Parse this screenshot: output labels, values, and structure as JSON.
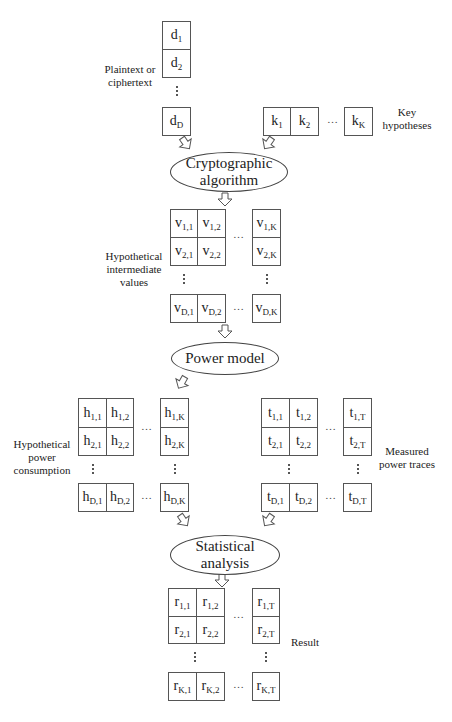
{
  "diagram": {
    "type": "flowchart",
    "title": "",
    "inputs": {
      "plaintext": {
        "label": "Plaintext or ciphertext",
        "cells": [
          "d1",
          "d2",
          "dD"
        ]
      },
      "keys": {
        "label": "Key hypotheses",
        "cells": [
          "k1",
          "k2",
          "kK"
        ]
      }
    },
    "steps": {
      "crypto": "Cryptographic algorithm",
      "power_model": "Power model",
      "statistical": "Statistical analysis"
    },
    "matrices": {
      "v": {
        "label": "Hypothetical intermediate values",
        "rows": [
          [
            "v1,1",
            "v1,2",
            "v1,K"
          ],
          [
            "v2,1",
            "v2,2",
            "v2,K"
          ],
          [
            "vD,1",
            "vD,2",
            "vD,K"
          ]
        ]
      },
      "h": {
        "label": "Hypothetical power consumption",
        "rows": [
          [
            "h1,1",
            "h1,2",
            "h1,K"
          ],
          [
            "h2,1",
            "h2,2",
            "h2,K"
          ],
          [
            "hD,1",
            "hD,2",
            "hD,K"
          ]
        ]
      },
      "t": {
        "label": "Measured power traces",
        "rows": [
          [
            "t1,1",
            "t1,2",
            "t1,T"
          ],
          [
            "t2,1",
            "t2,2",
            "t2,T"
          ],
          [
            "tD,1",
            "tD,2",
            "tD,T"
          ]
        ]
      },
      "r": {
        "label": "Result",
        "rows": [
          [
            "r1,1",
            "r1,2",
            "r1,T"
          ],
          [
            "r2,1",
            "r2,2",
            "r2,T"
          ],
          [
            "rK,1",
            "rK,2",
            "rK,T"
          ]
        ]
      }
    },
    "ellipsis_h": "…",
    "edges": [
      {
        "from": "dD",
        "to": "crypto"
      },
      {
        "from": "k1",
        "to": "crypto"
      },
      {
        "from": "crypto",
        "to": "v"
      },
      {
        "from": "v",
        "to": "power_model"
      },
      {
        "from": "power_model",
        "to": "h"
      },
      {
        "from": "h",
        "to": "statistical"
      },
      {
        "from": "t",
        "to": "statistical"
      },
      {
        "from": "statistical",
        "to": "r"
      }
    ],
    "label_parts": {
      "plaintext": [
        "Plaintext or",
        "ciphertext"
      ],
      "keys": [
        "Key",
        "hypotheses"
      ],
      "v": [
        "Hypothetical",
        "intermediate",
        "values"
      ],
      "h": [
        "Hypothetical",
        "power",
        "consumption"
      ],
      "t": [
        "Measured",
        "power traces"
      ],
      "crypto": [
        "Cryptographic",
        "algorithm"
      ],
      "statistical": [
        "Statistical",
        "analysis"
      ]
    }
  }
}
